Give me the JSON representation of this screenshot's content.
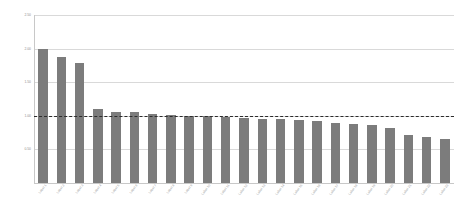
{
  "chart_data": {
    "type": "bar",
    "title": "",
    "subtitle": "",
    "xlabel": "",
    "ylabel": "",
    "ylim": [
      0.0,
      2.5
    ],
    "yticks": [
      "0.50",
      "1.00",
      "1.50",
      "2.00",
      "2.50"
    ],
    "ytick_values": [
      0.5,
      1.0,
      1.5,
      2.0,
      2.5
    ],
    "grid": true,
    "legend": null,
    "legend_position": "none",
    "bar_color": "#7c7c7c",
    "gridline_color": "#d9d9d9",
    "axis_color": "#c8c8c8",
    "background_color": "#ffffff",
    "reference_line": {
      "value": 1.0,
      "style": "dashed",
      "color": "#2b2b2b",
      "label": ""
    },
    "categories": [
      "Label 1",
      "Label 2",
      "Label 3",
      "Label 4",
      "Label 5",
      "Label 6",
      "Label 7",
      "Label 8",
      "Label 9",
      "Label 10",
      "Label 11",
      "Label 12",
      "Label 13",
      "Label 14",
      "Label 15",
      "Label 16",
      "Label 17",
      "Label 18",
      "Label 19",
      "Label 20",
      "Label 21",
      "Label 22",
      "Label 23"
    ],
    "values": [
      2.0,
      1.88,
      1.78,
      1.1,
      1.05,
      1.05,
      1.03,
      1.01,
      1.0,
      0.99,
      0.98,
      0.97,
      0.96,
      0.95,
      0.94,
      0.92,
      0.9,
      0.88,
      0.86,
      0.82,
      0.72,
      0.68,
      0.66
    ],
    "values_tail": [
      0.64,
      0.6
    ],
    "n_bars": 23
  },
  "axes": {
    "y_top_label": "2.50",
    "y_bottom_label": "0.50"
  }
}
